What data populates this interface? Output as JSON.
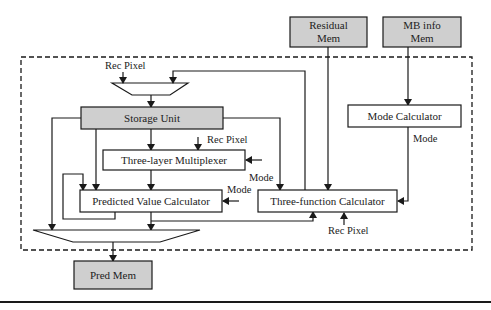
{
  "diagram": {
    "external_blocks": {
      "residual_mem": {
        "line1": "Residual",
        "line2": "Mem"
      },
      "mb_info_mem": {
        "line1": "MB info",
        "line2": "Mem"
      },
      "pred_mem": {
        "label": "Pred Mem"
      }
    },
    "internal_blocks": {
      "storage_unit": {
        "label": "Storage Unit"
      },
      "three_layer_mux": {
        "label": "Three-layer Multiplexer"
      },
      "predicted_value_calc": {
        "label": "Predicted Value Calculator"
      },
      "three_function_calc": {
        "label": "Three-function Calculator"
      },
      "mode_calculator": {
        "label": "Mode Calculator"
      }
    },
    "signal_labels": {
      "rec_pixel_top": "Rec Pixel",
      "rec_pixel_mux": "Rec Pixel",
      "rec_pixel_tfc": "Rec Pixel",
      "mode_mux": "Mode",
      "mode_pvc": "Mode",
      "mode_calc_out": "Mode"
    },
    "colors": {
      "gray_fill": "#cfcfcf",
      "line": "#1a1a1a",
      "background": "#ffffff"
    }
  }
}
